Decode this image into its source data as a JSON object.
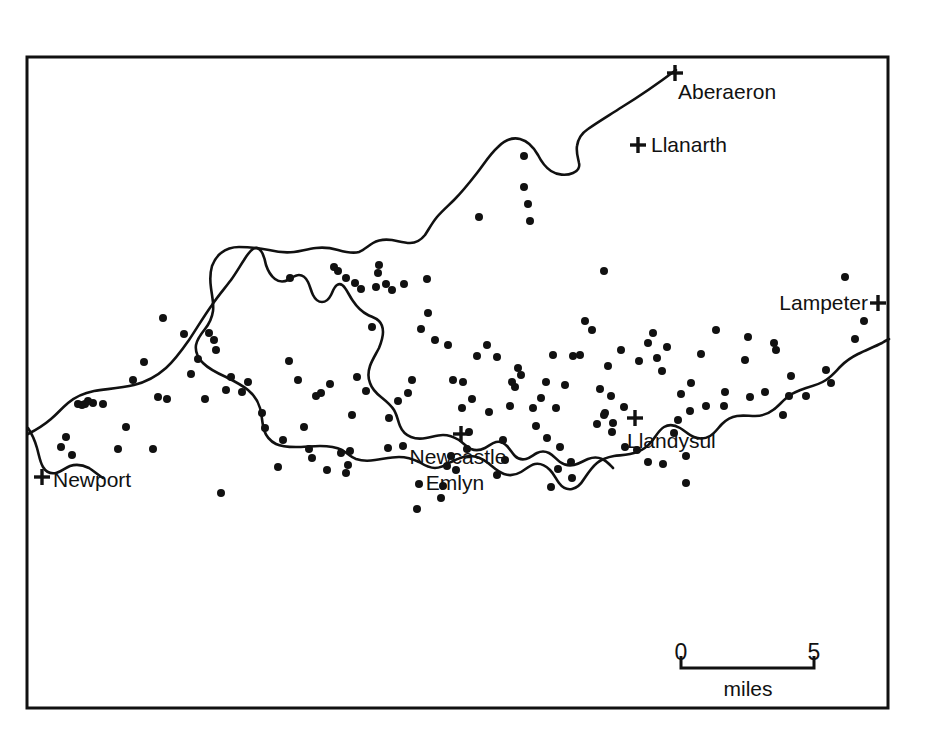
{
  "figure": {
    "type": "distribution-dot-map",
    "region": "Teifi Valley, south-west Wales",
    "background_color": "#ffffff",
    "ink_color": "#111111"
  },
  "frame": {
    "x": 27,
    "y": 57,
    "width": 861,
    "height": 651,
    "stroke_width": 3
  },
  "places": [
    {
      "name": "Aberaeron",
      "marker": "plus",
      "marker_x": 675,
      "marker_y": 73,
      "label_x": 678,
      "label_y": 99,
      "anchor": "start"
    },
    {
      "name": "Llanarth",
      "marker": "plus",
      "marker_x": 638,
      "marker_y": 145,
      "label_x": 651,
      "label_y": 152,
      "anchor": "start"
    },
    {
      "name": "Lampeter",
      "marker": "plus",
      "marker_x": 878,
      "marker_y": 303,
      "label_x": 868,
      "label_y": 310,
      "anchor": "end"
    },
    {
      "name": "Llandysul",
      "marker": "plus",
      "marker_x": 635,
      "marker_y": 418,
      "label_x": 627,
      "label_y": 448,
      "anchor": "start"
    },
    {
      "name": "Newcastle",
      "marker": "plus",
      "marker_x": 461,
      "marker_y": 434,
      "label_x": 458,
      "label_y": 464,
      "anchor": "middle"
    },
    {
      "name": "Emlyn",
      "marker": "none",
      "marker_x": 0,
      "marker_y": 0,
      "label_x": 455,
      "label_y": 490,
      "anchor": "middle"
    },
    {
      "name": "Newport",
      "marker": "plus",
      "marker_x": 42,
      "marker_y": 477,
      "label_x": 53,
      "label_y": 487,
      "anchor": "start"
    }
  ],
  "scale_bar": {
    "start_label": "0",
    "end_label": "5",
    "unit_label": "miles",
    "x_start": 681,
    "x_end": 814,
    "baseline_y": 668,
    "tick_height": 12,
    "num_y": 660,
    "unit_x": 748,
    "unit_y": 696
  },
  "chart_data": {
    "type": "scatter",
    "title": "",
    "xlabel": "",
    "ylabel": "",
    "dot_radius": 4,
    "dot_count": 163,
    "points": [
      [
        845,
        277
      ],
      [
        864,
        321
      ],
      [
        855,
        339
      ],
      [
        826,
        370
      ],
      [
        831,
        383
      ],
      [
        776,
        350
      ],
      [
        791,
        376
      ],
      [
        789,
        396
      ],
      [
        806,
        396
      ],
      [
        765,
        392
      ],
      [
        750,
        397
      ],
      [
        724,
        406
      ],
      [
        783,
        415
      ],
      [
        774,
        343
      ],
      [
        748,
        337
      ],
      [
        745,
        360
      ],
      [
        716,
        330
      ],
      [
        701,
        354
      ],
      [
        691,
        383
      ],
      [
        681,
        394
      ],
      [
        667,
        347
      ],
      [
        662,
        371
      ],
      [
        678,
        420
      ],
      [
        686,
        456
      ],
      [
        686,
        483
      ],
      [
        674,
        433
      ],
      [
        653,
        333
      ],
      [
        657,
        358
      ],
      [
        648,
        343
      ],
      [
        639,
        361
      ],
      [
        621,
        350
      ],
      [
        611,
        396
      ],
      [
        624,
        407
      ],
      [
        605,
        413
      ],
      [
        604,
        415
      ],
      [
        612,
        432
      ],
      [
        625,
        447
      ],
      [
        637,
        450
      ],
      [
        648,
        462
      ],
      [
        663,
        464
      ],
      [
        604,
        271
      ],
      [
        608,
        366
      ],
      [
        592,
        330
      ],
      [
        600,
        389
      ],
      [
        585,
        321
      ],
      [
        580,
        355
      ],
      [
        573,
        356
      ],
      [
        565,
        385
      ],
      [
        553,
        355
      ],
      [
        546,
        382
      ],
      [
        541,
        398
      ],
      [
        536,
        426
      ],
      [
        547,
        438
      ],
      [
        560,
        447
      ],
      [
        571,
        462
      ],
      [
        572,
        478
      ],
      [
        558,
        469
      ],
      [
        551,
        487
      ],
      [
        528,
        204
      ],
      [
        524,
        156
      ],
      [
        524,
        187
      ],
      [
        530,
        221
      ],
      [
        518,
        368
      ],
      [
        515,
        387
      ],
      [
        510,
        406
      ],
      [
        503,
        440
      ],
      [
        505,
        460
      ],
      [
        497,
        475
      ],
      [
        489,
        412
      ],
      [
        479,
        217
      ],
      [
        472,
        399
      ],
      [
        469,
        432
      ],
      [
        467,
        449
      ],
      [
        462,
        408
      ],
      [
        451,
        456
      ],
      [
        456,
        470
      ],
      [
        447,
        466
      ],
      [
        443,
        486
      ],
      [
        441,
        498
      ],
      [
        427,
        279
      ],
      [
        421,
        329
      ],
      [
        419,
        484
      ],
      [
        417,
        509
      ],
      [
        412,
        380
      ],
      [
        408,
        393
      ],
      [
        403,
        446
      ],
      [
        398,
        401
      ],
      [
        389,
        418
      ],
      [
        388,
        448
      ],
      [
        379,
        265
      ],
      [
        376,
        287
      ],
      [
        372,
        327
      ],
      [
        366,
        391
      ],
      [
        357,
        377
      ],
      [
        352,
        415
      ],
      [
        350,
        451
      ],
      [
        348,
        465
      ],
      [
        346,
        473
      ],
      [
        341,
        453
      ],
      [
        334,
        267
      ],
      [
        330,
        384
      ],
      [
        327,
        470
      ],
      [
        321,
        393
      ],
      [
        316,
        396
      ],
      [
        312,
        458
      ],
      [
        309,
        449
      ],
      [
        304,
        427
      ],
      [
        298,
        380
      ],
      [
        289,
        361
      ],
      [
        283,
        440
      ],
      [
        278,
        467
      ],
      [
        265,
        428
      ],
      [
        262,
        413
      ],
      [
        248,
        382
      ],
      [
        242,
        392
      ],
      [
        231,
        377
      ],
      [
        226,
        390
      ],
      [
        221,
        493
      ],
      [
        216,
        350
      ],
      [
        214,
        340
      ],
      [
        209,
        333
      ],
      [
        205,
        399
      ],
      [
        198,
        359
      ],
      [
        191,
        374
      ],
      [
        184,
        334
      ],
      [
        167,
        399
      ],
      [
        163,
        318
      ],
      [
        158,
        397
      ],
      [
        153,
        449
      ],
      [
        144,
        362
      ],
      [
        133,
        380
      ],
      [
        126,
        427
      ],
      [
        118,
        449
      ],
      [
        103,
        404
      ],
      [
        93,
        403
      ],
      [
        88,
        401
      ],
      [
        85,
        404
      ],
      [
        82,
        405
      ],
      [
        78,
        404
      ],
      [
        66,
        437
      ],
      [
        61,
        447
      ],
      [
        72,
        455
      ],
      [
        290,
        278
      ],
      [
        338,
        271
      ],
      [
        346,
        278
      ],
      [
        355,
        283
      ],
      [
        361,
        289
      ],
      [
        378,
        273
      ],
      [
        386,
        284
      ],
      [
        392,
        290
      ],
      [
        404,
        284
      ],
      [
        428,
        313
      ],
      [
        435,
        340
      ],
      [
        448,
        345
      ],
      [
        453,
        380
      ],
      [
        463,
        382
      ],
      [
        477,
        356
      ],
      [
        487,
        345
      ],
      [
        497,
        357
      ],
      [
        512,
        382
      ],
      [
        521,
        375
      ],
      [
        533,
        408
      ],
      [
        556,
        408
      ],
      [
        597,
        424
      ],
      [
        613,
        423
      ],
      [
        690,
        411
      ],
      [
        706,
        406
      ],
      [
        725,
        392
      ]
    ]
  },
  "coastline": {
    "name": "coast-and-river-outline",
    "stroke_width": 2.6,
    "paths": [
      "M 676 70 C 660 82, 640 96, 622 107 C 608 116, 598 122, 588 129 C 582 133, 578 139, 577 146 C 576 152, 578 158, 579 163 C 580 167, 578 171, 573 173 C 566 176, 557 175, 551 171 C 545 167, 541 161, 538 155 C 534 148, 528 141, 520 139 C 512 137, 504 141, 498 147 C 490 154, 484 164, 477 173 C 470 182, 462 192, 454 200 C 448 206, 442 211, 437 217 C 432 223, 429 229, 425 235 C 421 240, 416 243, 410 243 C 404 243, 398 241, 392 240 C 385 239, 378 240, 373 243 C 368 246, 364 250, 359 252 C 352 254, 345 252, 338 250 C 331 248, 323 247, 316 248 C 308 249, 301 251, 294 252 C 286 253, 277 252, 269 250 C 259 248, 248 247, 239 247 C 232 247, 226 249, 221 253 C 217 256, 214 261, 212 266 C 210 273, 210 281, 211 288 C 212 296, 214 304, 213 311 C 212 318, 209 324, 205 329 C 201 334, 197 339, 196 345 C 195 352, 198 358, 203 363 C 209 369, 217 373, 226 377 C 234 381, 242 385, 248 390 C 254 395, 258 401, 260 408 C 262 415, 262 423, 264 430 C 266 436, 270 441, 276 444 C 282 447, 289 447, 296 447 C 304 447, 312 446, 320 446 C 328 446, 336 447, 342 450 C 347 453, 351 457, 356 459 C 362 461, 369 461, 375 460 C 383 459, 391 457, 399 457 C 406 457, 413 459, 419 462 C 424 465, 429 468, 435 468 C 441 468, 446 465, 451 462 C 457 459, 463 456, 470 456 C 477 456, 483 459, 488 463 C 493 467, 498 472, 504 474 C 510 476, 516 475, 521 472 C 526 469, 530 465, 535 464 C 541 463, 546 466, 550 470 C 554 474, 556 479, 559 483 C 562 487, 567 490, 572 489 C 577 488, 581 484, 584 479 C 588 473, 592 467, 597 463 C 602 459, 608 457, 614 456 C 622 455, 630 455, 637 452 C 643 450, 648 446, 652 441 C 656 436, 659 430, 664 427 C 669 424, 675 425, 680 428 C 685 431, 689 435, 694 437 C 699 439, 705 439, 710 436 C 715 433, 718 428, 722 424 C 726 420, 731 417, 737 416 C 743 415, 749 416, 755 416 C 762 416, 768 414, 773 410 C 779 406, 783 400, 789 396 C 794 392, 800 390, 806 388 C 813 386, 820 384, 826 380 C 832 376, 836 371, 841 366 C 846 361, 852 357, 858 354 C 866 350, 874 347, 882 343 C 885 341, 887 340, 889 339",
      "M 28 434 C 36 430, 44 425, 51 419 C 57 414, 62 408, 68 403 C 75 397, 84 393, 94 391 C 107 389, 121 388, 134 385 C 146 382, 157 376, 166 368 C 175 360, 182 350, 189 340 C 197 328, 204 316, 212 305 C 218 296, 225 288, 231 280 C 236 273, 240 266, 244 260 C 247 255, 250 251, 253 249 C 256 247, 259 248, 261 251 C 264 255, 265 260, 266 265 C 268 271, 271 276, 275 279 C 279 282, 284 282, 288 280 C 292 278, 295 275, 299 275 C 303 275, 306 278, 308 282 C 310 286, 311 291, 313 295 C 315 299, 318 302, 322 302 C 326 302, 329 299, 331 295 C 333 291, 334 287, 337 285 C 340 283, 343 285, 345 288 C 348 292, 350 297, 353 301 C 357 307, 362 312, 368 315 C 372 317, 376 318, 379 321 C 382 324, 383 328, 383 332 C 383 338, 381 343, 379 348 C 376 354, 372 360, 370 366 C 368 372, 368 378, 370 383 C 372 389, 376 393, 381 397 C 386 401, 391 405, 394 410 C 397 415, 398 421, 400 426 C 402 431, 406 435, 411 437 C 416 439, 421 439, 426 438 C 432 437, 437 435, 443 435 C 449 435, 454 437, 459 440 C 463 443, 467 447, 471 449 C 476 451, 481 450, 485 448 C 489 446, 492 443, 496 442 C 500 441, 504 443, 507 446 C 510 449, 512 453, 515 456 C 518 459, 522 460, 526 459 C 530 458, 533 455, 537 453 C 541 451, 545 451, 549 453 C 553 455, 556 459, 560 462 C 564 465, 569 466, 574 465 C 579 464, 583 461, 588 459 C 593 457, 598 457, 602 459 C 607 461, 610 465, 613 468",
      "M 28 428 C 32 434, 35 441, 37 448 C 39 455, 40 462, 43 467 C 46 472, 51 474, 56 473 C 61 472, 65 468, 70 466 C 76 464, 83 465, 89 468 C 94 471, 98 475, 103 478"
    ]
  }
}
